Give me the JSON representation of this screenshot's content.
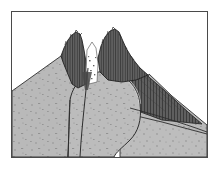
{
  "figure": {
    "kind": "geological-cross-section",
    "caption": "",
    "frame": {
      "x": 11,
      "y": 11,
      "width": 197,
      "height": 147,
      "border_color": "#4a4a4a",
      "background_color": "#ffffff"
    },
    "palette": {
      "sky": "#ffffff",
      "light_deposit": "#b9b9b9",
      "light_deposit_alt": "#c3c3c3",
      "dome_fill": "#bcbcbc",
      "dark_unit": "#5f5f5f",
      "dark_unit_shadow": "#4a4a4a",
      "outline": "#2e2e2e",
      "stipple": "#8a8a8a",
      "hatch": "#3a3a3a"
    },
    "units": [
      {
        "id": "left-flank-deposit",
        "label": "Left flank pyroclastic deposit",
        "fill": "#b9b9b9",
        "texture": "stipple"
      },
      {
        "id": "right-flank-deposit",
        "label": "Right flank pyroclastic deposit",
        "fill": "#b9b9b9",
        "texture": "stipple"
      },
      {
        "id": "left-summit-spine",
        "label": "Left summit spine",
        "fill": "#5f5f5f",
        "texture": "vertical-hatch"
      },
      {
        "id": "right-summit-spine",
        "label": "Right summit spine",
        "fill": "#5f5f5f",
        "texture": "vertical-hatch"
      },
      {
        "id": "summit-crater-notch",
        "label": "Summit crater notch",
        "fill": "#ffffff",
        "texture": "none"
      },
      {
        "id": "lava-dome",
        "label": "Lava dome / cryptodome",
        "fill": "#bcbcbc",
        "texture": "stipple"
      },
      {
        "id": "right-dark-wedge",
        "label": "Dark debris wedge on right flank",
        "fill": "#5f5f5f",
        "texture": "vertical-hatch"
      },
      {
        "id": "basement-deposit",
        "label": "Basal deposit",
        "fill": "#b9b9b9",
        "texture": "stipple"
      },
      {
        "id": "conduit",
        "label": "Feeder conduit / dike",
        "stroke": "#2e2e2e"
      }
    ],
    "geometry": {
      "left_ridge": "M0,147 L0,82 L57,46 L72,52 L78,78 L64,86 L60,147 Z",
      "right_ridge": "M126,70 L160,96 L197,121 L197,147 L150,147 Z",
      "basement": "M0,147 L0,86 L58,88 L62,147 Z",
      "dome": "M64,86 C 72,62 112,64 126,86 C 140,108 146,147 146,147 L62,147 Z",
      "left_spine": "M57,46 L60,40 L66,33 L71,30 L76,32 L79,42 L82,56 L84,78 L70,84 L62,74 L57,56 Z",
      "right_spine": "M92,54 L97,41 L104,33 L110,31 L116,36 L124,50 L135,62 L146,71 L132,78 L112,80 L96,76 L91,66 Z",
      "right_wedge": "M146,71 L160,90 L176,110 L150,112 L120,104 L112,92 L128,80 Z",
      "conduit_line": "M78,62 C 77,86 75,112 74,147"
    }
  }
}
